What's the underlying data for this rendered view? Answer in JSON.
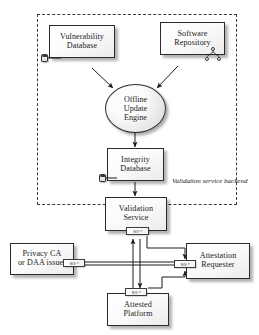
{
  "diagram": {
    "boundary": {
      "label_line1": "Validation",
      "label_line2": "service backend"
    },
    "nodes": {
      "vulnerability_database": {
        "line1": "Vulnerability",
        "line2": "Database"
      },
      "software_repository": {
        "line1": "Software",
        "line2": "Repository"
      },
      "offline_update_engine": {
        "line1": "Offline",
        "line2": "Update",
        "line3": "Engine"
      },
      "integrity_database": {
        "line1": "Integrity",
        "line2": "Database"
      },
      "validation_service": {
        "line1": "Validation",
        "line2": "Service"
      },
      "privacy_ca": {
        "line1": "Privacy CA",
        "line2": "or DAA issuer"
      },
      "attestation_requester": {
        "line1": "Attestation",
        "line2": "Requester"
      },
      "attested_platform": {
        "line1": "Attested",
        "line2": "Platform"
      }
    },
    "connector_tags": {
      "validation_service_ws": "WS-*",
      "privacy_ca_ws": "WS-*",
      "attestation_requester_ws": "WS-*",
      "attested_platform_ws": "WS-*"
    },
    "icons": {
      "vulnerability_db_interface": "database-cylinder-icon",
      "integrity_db_interface": "database-cylinder-icon",
      "software_repo_interface_1": "lollipop-interface-icon",
      "software_repo_interface_2": "lollipop-interface-icon",
      "software_repo_interface_3": "lollipop-interface-icon"
    },
    "colors": {
      "stroke": "#2b2b2b",
      "fill_light": "#ffffff",
      "fill_shade": "#e6e6e6",
      "background": "#ffffff"
    }
  }
}
